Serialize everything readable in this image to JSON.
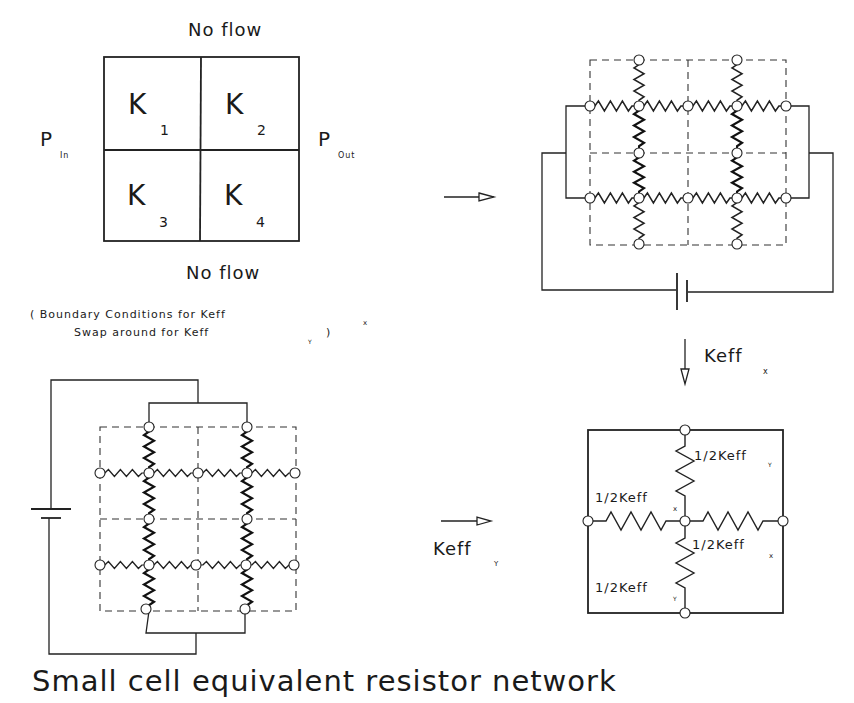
{
  "title": "Small cell equivalent resistor network",
  "panel_boundary": {
    "top_label": "No flow",
    "bottom_label": "No flow",
    "left_label": "P",
    "left_sub": "In",
    "right_label": "P",
    "right_sub": "Out",
    "cells": [
      {
        "label": "K",
        "sub": "1"
      },
      {
        "label": "K",
        "sub": "2"
      },
      {
        "label": "K",
        "sub": "3"
      },
      {
        "label": "K",
        "sub": "4"
      }
    ],
    "caption_line1": "( Boundary Conditions for Keff",
    "caption_line1_sub": "x",
    "caption_line2": "Swap around for Keff",
    "caption_line2_sub": "Y",
    "caption_line2_end": ")"
  },
  "arrows": {
    "to_x_network": {
      "label": ""
    },
    "down_keff_x": {
      "label": "Keff",
      "sub": "x"
    },
    "from_y_network": {
      "label": "Keff",
      "sub": "Y"
    }
  },
  "equivalent_network": {
    "top_right": {
      "label": "1/2Keff",
      "sub": "Y"
    },
    "left": {
      "label": "1/2Keff",
      "sub": "x"
    },
    "right": {
      "label": "1/2Keff",
      "sub": "x"
    },
    "bottom_left": {
      "label": "1/2Keff",
      "sub": "Y"
    }
  }
}
